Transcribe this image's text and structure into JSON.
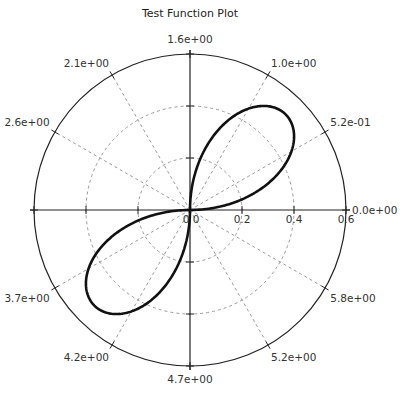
{
  "chart_data": {
    "type": "polar-line",
    "title": "Test Function Plot",
    "function": "r = 0.52 * sin(2*theta), plotted where r >= 0",
    "center_px": [
      190,
      210
    ],
    "r_max": 0.6,
    "r_max_px": 156,
    "radial_ticks": [
      0,
      0.2,
      0.4,
      0.6
    ],
    "radial_tick_labels": [
      "0",
      "0.2",
      "0.4",
      "0.6"
    ],
    "angular_ticks_deg": [
      0,
      30,
      60,
      90,
      120,
      150,
      180,
      210,
      240,
      270,
      300,
      330
    ],
    "angular_tick_labels": [
      "0.0e+00",
      "5.2e-01",
      "1.0e+00",
      "1.6e+00",
      "2.1e+00",
      "2.6e+00",
      "",
      "3.7e+00",
      "4.2e+00",
      "4.7e+00",
      "5.2e+00",
      "5.8e+00"
    ],
    "series": [
      {
        "name": "test function",
        "amplitude": 0.52,
        "petals": 2,
        "points_theta_r": [
          [
            0.0,
            0.0
          ],
          [
            0.2618,
            0.26
          ],
          [
            0.5236,
            0.45
          ],
          [
            0.7854,
            0.52
          ],
          [
            1.0472,
            0.45
          ],
          [
            1.309,
            0.26
          ],
          [
            1.5708,
            0.0
          ],
          [
            3.1416,
            0.0
          ],
          [
            3.4034,
            0.26
          ],
          [
            3.6652,
            0.45
          ],
          [
            3.927,
            0.52
          ],
          [
            4.1888,
            0.45
          ],
          [
            4.4506,
            0.26
          ],
          [
            4.7124,
            0.0
          ]
        ],
        "color": "#111111"
      }
    ],
    "grid": true,
    "grid_color": "#9a9a9a",
    "legend": null
  }
}
